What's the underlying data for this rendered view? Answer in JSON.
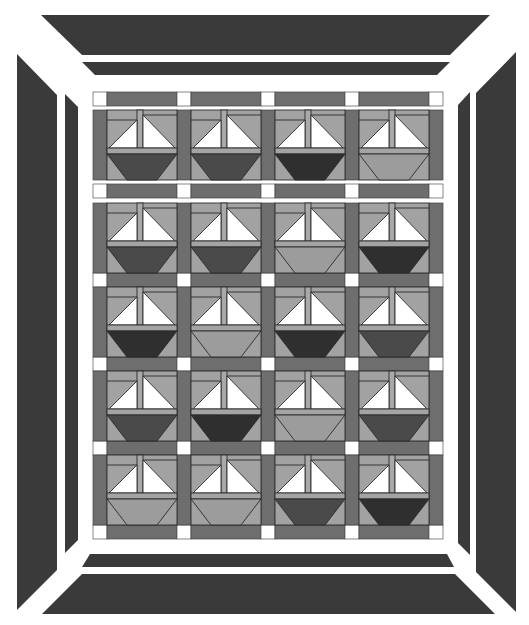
{
  "canvas": {
    "width": 529,
    "height": 625,
    "background": "#ffffff"
  },
  "colors": {
    "border_dark": "#3a3a3a",
    "sashing": "#6e6e6e",
    "cornerstone": "#ffffff",
    "block_bg": "#a2a2a2",
    "sail": "#ffffff",
    "mast": "#a9a9a9",
    "deck": "#a4a4a4",
    "outline": "#2a2a2a",
    "hull_D": "#2f2f2f",
    "hull_M": "#4a4a4a",
    "hull_L": "#9c9c9c"
  },
  "borders": {
    "outer_top": [
      [
        41,
        15
      ],
      [
        490,
        15
      ],
      [
        450,
        55
      ],
      [
        82,
        55
      ]
    ],
    "inner_top": [
      [
        82,
        62
      ],
      [
        450,
        62
      ],
      [
        437,
        75
      ],
      [
        95,
        75
      ]
    ],
    "outer_left": [
      [
        17,
        54
      ],
      [
        57,
        95
      ],
      [
        57,
        570
      ],
      [
        17,
        610
      ]
    ],
    "inner_left": [
      [
        65,
        94
      ],
      [
        78,
        107
      ],
      [
        78,
        540
      ],
      [
        65,
        553
      ]
    ],
    "outer_right": [
      [
        516,
        52
      ],
      [
        516,
        612
      ],
      [
        476,
        572
      ],
      [
        476,
        93
      ]
    ],
    "inner_right": [
      [
        470,
        92
      ],
      [
        470,
        555
      ],
      [
        458,
        543
      ],
      [
        458,
        105
      ]
    ],
    "inner_bottom": [
      [
        90,
        554
      ],
      [
        447,
        554
      ],
      [
        454,
        567
      ],
      [
        82,
        567
      ]
    ],
    "outer_bottom": [
      [
        82,
        574
      ],
      [
        455,
        574
      ],
      [
        495,
        614
      ],
      [
        42,
        614
      ]
    ]
  },
  "field": {
    "x0": 93,
    "sash": 14,
    "block": 70,
    "columns": 4,
    "row_tops": [
      110,
      203,
      287,
      371,
      455
    ],
    "sash_row_tops": [
      92,
      184,
      273,
      357,
      441,
      525
    ],
    "first_row_gap_top": 106,
    "first_sash_gap": [
      180,
      184
    ]
  },
  "hulls": [
    [
      "M",
      "M",
      "D",
      "L"
    ],
    [
      "M",
      "M",
      "L",
      "D"
    ],
    [
      "D",
      "L",
      "D",
      "M"
    ],
    [
      "M",
      "D",
      "L",
      "M"
    ],
    [
      "L",
      "L",
      "M",
      "D"
    ]
  ],
  "block_count": 20
}
